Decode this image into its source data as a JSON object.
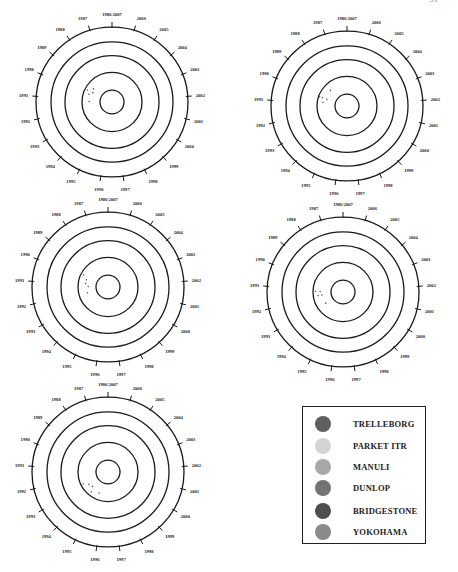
{
  "page": {
    "page_number": "51"
  },
  "chart_data": [
    {
      "type": "scatter",
      "subtype": "polar-target",
      "title": "",
      "angular_labels": [
        "1986/2007",
        "2006",
        "2005",
        "2004",
        "2003",
        "2002",
        "2001",
        "2000",
        "1999",
        "1998",
        "1997",
        "1996",
        "1995",
        "1994",
        "1993",
        "1992",
        "1991",
        "1990",
        "1989",
        "1988",
        "1987"
      ],
      "ring_count": 5,
      "points": [
        {
          "angle_label": "1990",
          "radius_fraction": 0.32
        },
        {
          "angle_label": "1990",
          "radius_fraction": 0.28
        },
        {
          "angle_label": "1989",
          "radius_fraction": 0.3
        },
        {
          "angle_label": "1990",
          "radius_fraction": 0.36
        },
        {
          "angle_label": "1991",
          "radius_fraction": 0.3
        }
      ]
    },
    {
      "type": "scatter",
      "subtype": "polar-target",
      "title": "",
      "angular_labels": [
        "1986/2007",
        "2006",
        "2005",
        "2004",
        "2003",
        "2002",
        "2001",
        "2000",
        "1999",
        "1998",
        "1997",
        "1996",
        "1995",
        "1994",
        "1993",
        "1992",
        "1991",
        "1990",
        "1989",
        "1988",
        "1987"
      ],
      "ring_count": 5,
      "points": [
        {
          "angle_label": "1990",
          "radius_fraction": 0.34
        },
        {
          "angle_label": "1989",
          "radius_fraction": 0.3
        },
        {
          "angle_label": "1990",
          "radius_fraction": 0.28
        },
        {
          "angle_label": "1991",
          "radius_fraction": 0.32
        },
        {
          "angle_label": "1990",
          "radius_fraction": 0.38
        }
      ]
    },
    {
      "type": "scatter",
      "subtype": "polar-target",
      "title": "",
      "angular_labels": [
        "1986/2007",
        "2006",
        "2005",
        "2004",
        "2003",
        "2002",
        "2001",
        "2000",
        "1999",
        "1998",
        "1997",
        "1996",
        "1995",
        "1994",
        "1993",
        "1992",
        "1991",
        "1990",
        "1989",
        "1988",
        "1987"
      ],
      "ring_count": 5,
      "points": [
        {
          "angle_label": "1990",
          "radius_fraction": 0.3
        },
        {
          "angle_label": "1991",
          "radius_fraction": 0.3
        },
        {
          "angle_label": "1991",
          "radius_fraction": 0.26
        },
        {
          "angle_label": "1990",
          "radius_fraction": 0.36
        },
        {
          "angle_label": "1992",
          "radius_fraction": 0.28
        }
      ]
    },
    {
      "type": "scatter",
      "subtype": "polar-target",
      "title": "",
      "angular_labels": [
        "1986/2007",
        "2006",
        "2005",
        "2004",
        "2003",
        "2002",
        "2001",
        "2000",
        "1999",
        "1998",
        "1997",
        "1996",
        "1995",
        "1994",
        "1993",
        "1992",
        "1991",
        "1990",
        "1989",
        "1988",
        "1987"
      ],
      "ring_count": 5,
      "points": [
        {
          "angle_label": "1991",
          "radius_fraction": 0.3
        },
        {
          "angle_label": "1992",
          "radius_fraction": 0.28
        },
        {
          "angle_label": "1991",
          "radius_fraction": 0.36
        },
        {
          "angle_label": "1992",
          "radius_fraction": 0.33
        },
        {
          "angle_label": "1993",
          "radius_fraction": 0.27
        }
      ]
    },
    {
      "type": "scatter",
      "subtype": "polar-target",
      "title": "",
      "angular_labels": [
        "1986/2007",
        "2006",
        "2005",
        "2004",
        "2003",
        "2002",
        "2001",
        "2000",
        "1999",
        "1998",
        "1997",
        "1996",
        "1995",
        "1994",
        "1993",
        "1992",
        "1991",
        "1990",
        "1989",
        "1988",
        "1987"
      ],
      "ring_count": 5,
      "points": [
        {
          "angle_label": "1993",
          "radius_fraction": 0.3
        },
        {
          "angle_label": "1994",
          "radius_fraction": 0.28
        },
        {
          "angle_label": "1994",
          "radius_fraction": 0.34
        },
        {
          "angle_label": "1993",
          "radius_fraction": 0.36
        },
        {
          "angle_label": "1995",
          "radius_fraction": 0.3
        }
      ]
    }
  ],
  "legend": {
    "placement": "bottom-right",
    "items": [
      {
        "label": "TRELLEBORG",
        "color": "#5f5f5f"
      },
      {
        "label": "PARKET ITR",
        "color": "#d4d4d4"
      },
      {
        "label": "MANULI",
        "color": "#a8a8a8"
      },
      {
        "label": "DUNLOP",
        "color": "#737373"
      },
      {
        "label": "BRIDGESTONE",
        "color": "#4e4e4e"
      },
      {
        "label": "YOKOHAMA",
        "color": "#8a8a8a"
      }
    ]
  }
}
